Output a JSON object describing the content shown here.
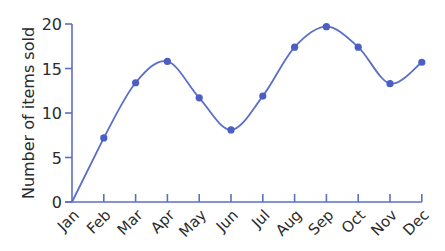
{
  "chart_data": {
    "type": "line",
    "title": "",
    "xlabel": "",
    "ylabel": "Number of items sold",
    "categories": [
      "Jan",
      "Feb",
      "Mar",
      "Apr",
      "May",
      "Jun",
      "Jul",
      "Aug",
      "Sep",
      "Oct",
      "Nov",
      "Dec"
    ],
    "series": [
      {
        "name": "Number of items sold",
        "values": [
          0,
          7.2,
          13.4,
          15.8,
          11.7,
          8.1,
          11.9,
          17.4,
          19.7,
          17.4,
          13.3,
          15.7
        ],
        "smooth": true,
        "markers": true
      }
    ],
    "ylim": [
      0,
      20
    ],
    "yticks": [
      0,
      5,
      10,
      15,
      20
    ],
    "grid": false,
    "legend": "none",
    "colors": {
      "axis": "#5b6ec8",
      "line": "#5b6ec8",
      "marker": "#4a5ec6",
      "text": "#2b2b2b"
    }
  }
}
